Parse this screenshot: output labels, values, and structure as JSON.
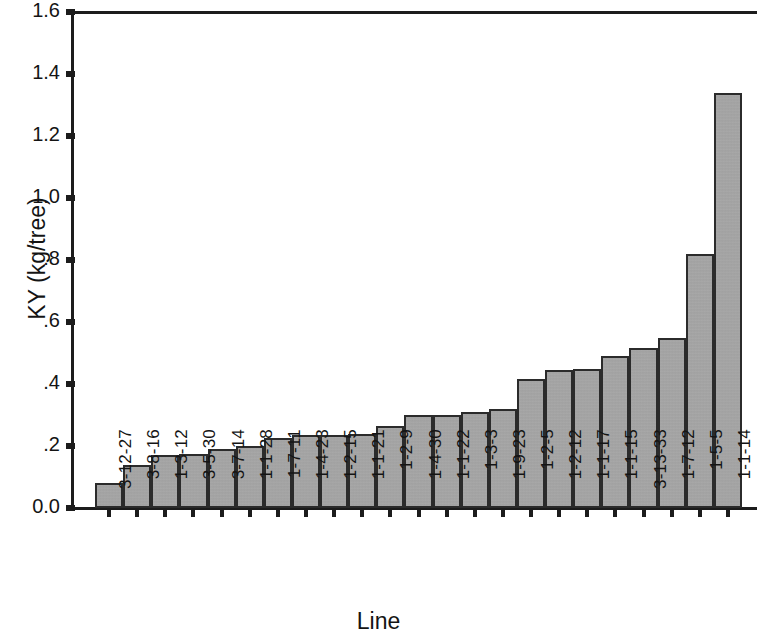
{
  "chart_data": {
    "type": "bar",
    "title": "",
    "xlabel": "Line",
    "ylabel": "KY (kg/tree)",
    "ylim": [
      0.0,
      1.6
    ],
    "grid": false,
    "legend": null,
    "y_tick_values": [
      0.0,
      0.2,
      0.4,
      0.6,
      0.8,
      1.0,
      1.2,
      1.4,
      1.6
    ],
    "y_tick_labels": [
      "0.0",
      ".2",
      ".4",
      ".6",
      ".8",
      "1.0",
      "1.2",
      "1.4",
      "1.6"
    ],
    "categories": [
      "3-12-27",
      "3-8-16",
      "1-3-12",
      "3-5-30",
      "3-7-14",
      "1-1-28",
      "1-7-11",
      "1-4-23",
      "1-2-15",
      "1-1-21",
      "1-2-9",
      "1-4-30",
      "1-1-22",
      "1-3-3",
      "1-9-23",
      "1-2-5",
      "1-2-12",
      "1-1-17",
      "1-1-15",
      "3-13-33",
      "1-7-12",
      "1-5-5",
      "1-1-14"
    ],
    "values": [
      0.08,
      0.14,
      0.17,
      0.175,
      0.19,
      0.2,
      0.225,
      0.235,
      0.235,
      0.24,
      0.265,
      0.3,
      0.3,
      0.31,
      0.32,
      0.415,
      0.445,
      0.45,
      0.49,
      0.515,
      0.55,
      0.82,
      1.34
    ],
    "bar_color": "#a9a9a9",
    "bar_edge_color": "#2b2b2b",
    "axis_color": "#1c1c1c"
  }
}
